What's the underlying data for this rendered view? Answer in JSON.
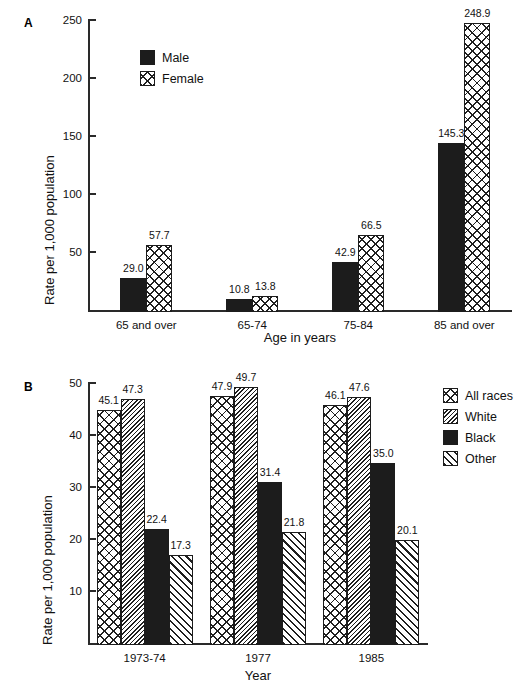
{
  "figure": {
    "panel_a_letter": "A",
    "panel_b_letter": "B"
  },
  "chart_data": [
    {
      "panel": "A",
      "type": "bar",
      "title": "",
      "xlabel": "Age in years",
      "ylabel": "Rate per 1,000 population",
      "categories": [
        "65 and over",
        "65-74",
        "75-84",
        "85 and over"
      ],
      "ylim": [
        0,
        250
      ],
      "yticks": [
        50,
        100,
        150,
        200,
        250
      ],
      "grid": false,
      "legend_position": "upper-left-inside",
      "series": [
        {
          "name": "Male",
          "pattern": "solid",
          "values": [
            29.0,
            10.8,
            42.9,
            145.3
          ]
        },
        {
          "name": "Female",
          "pattern": "cross",
          "values": [
            57.7,
            13.8,
            66.5,
            248.9
          ]
        }
      ],
      "labels": [
        [
          "29.0",
          "10.8",
          "42.9",
          "145.3"
        ],
        [
          "57.7",
          "13.8",
          "66.5",
          "248.9"
        ]
      ]
    },
    {
      "panel": "B",
      "type": "bar",
      "title": "",
      "xlabel": "Year",
      "ylabel": "Rate per 1,000 population",
      "categories": [
        "1973-74",
        "1977",
        "1985"
      ],
      "ylim": [
        0,
        50
      ],
      "yticks": [
        10,
        20,
        30,
        40,
        50
      ],
      "grid": false,
      "legend_position": "right",
      "series": [
        {
          "name": "All races",
          "pattern": "cross",
          "values": [
            45.1,
            47.9,
            46.1
          ]
        },
        {
          "name": "White",
          "pattern": "backhatch",
          "values": [
            47.3,
            49.7,
            47.6
          ]
        },
        {
          "name": "Black",
          "pattern": "solid",
          "values": [
            22.4,
            31.4,
            35.0
          ]
        },
        {
          "name": "Other",
          "pattern": "fwdhatch",
          "values": [
            17.3,
            21.8,
            20.1
          ]
        }
      ],
      "labels": [
        [
          "45.1",
          "47.9",
          "46.1"
        ],
        [
          "47.3",
          "49.7",
          "47.6"
        ],
        [
          "22.4",
          "31.4",
          "35.0"
        ],
        [
          "17.3",
          "21.8",
          "20.1"
        ]
      ]
    }
  ]
}
